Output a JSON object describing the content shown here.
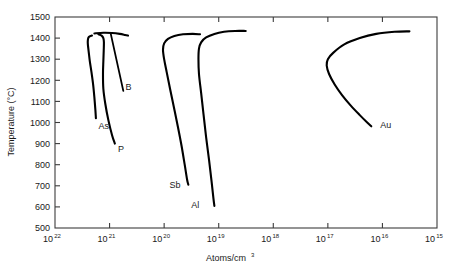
{
  "chart_data": {
    "type": "line",
    "title": "",
    "subtitle": "",
    "xlabel": "Atoms/cm",
    "xlabel_sup": "3",
    "ylabel": "Temperature (°C)",
    "xscale": "log",
    "x_reversed": true,
    "xlim": [
      1e+22,
      1000000000000000.0
    ],
    "ylim": [
      500,
      1500
    ],
    "grid": false,
    "legend_position": "inline-curve-labels",
    "xticks": [
      "10^22",
      "10^21",
      "10^20",
      "10^19",
      "10^18",
      "10^17",
      "10^16",
      "10^15"
    ],
    "xtick_mantissa": [
      "10",
      "10",
      "10",
      "10",
      "10",
      "10",
      "10",
      "10"
    ],
    "xtick_exponents": [
      "22",
      "21",
      "20",
      "19",
      "18",
      "17",
      "16",
      "15"
    ],
    "yticks": [
      1500,
      1400,
      1300,
      1200,
      1100,
      1000,
      900,
      800,
      700,
      600,
      500
    ],
    "ytick_labels": [
      "1500",
      "1400",
      "1300",
      "1200",
      "1100",
      "1000",
      "900",
      "800",
      "700",
      "600",
      "500"
    ],
    "series": [
      {
        "name": "As",
        "label": "As",
        "label_x_atoms": 1.6e+21,
        "label_y_temp": 970,
        "points": [
          [
            2.1e+21,
            1412
          ],
          [
            2.4e+21,
            1405
          ],
          [
            2.5e+21,
            1390
          ],
          [
            2.5e+21,
            1370
          ],
          [
            2.4e+21,
            1330
          ],
          [
            2.3e+21,
            1290
          ],
          [
            2.15e+21,
            1240
          ],
          [
            2e+21,
            1180
          ],
          [
            1.9e+21,
            1120
          ],
          [
            1.82e+21,
            1060
          ],
          [
            1.78e+21,
            1020
          ]
        ]
      },
      {
        "name": "P",
        "label": "P",
        "label_x_atoms": 7e+20,
        "label_y_temp": 860,
        "points": [
          [
            1.6e+21,
            1418
          ],
          [
            1.4e+21,
            1412
          ],
          [
            1.3e+21,
            1400
          ],
          [
            1.27e+21,
            1380
          ],
          [
            1.28e+21,
            1340
          ],
          [
            1.3e+21,
            1290
          ],
          [
            1.32e+21,
            1230
          ],
          [
            1.3e+21,
            1160
          ],
          [
            1.2e+21,
            1090
          ],
          [
            1.05e+21,
            1010
          ],
          [
            9e+20,
            940
          ],
          [
            8e+20,
            900
          ]
        ]
      },
      {
        "name": "B",
        "label": "B",
        "label_x_atoms": 5.1e+20,
        "label_y_temp": 1155,
        "leader_from": [
          9.5e+20,
          1420
        ],
        "leader_to": [
          5.6e+20,
          1150
        ],
        "points": [
          [
            1.9e+21,
            1422
          ],
          [
            1.3e+21,
            1425
          ],
          [
            9e+20,
            1424
          ],
          [
            6.5e+20,
            1420
          ],
          [
            5.2e+20,
            1415
          ],
          [
            4.6e+20,
            1412
          ]
        ]
      },
      {
        "name": "Sb",
        "label": "Sb",
        "label_x_atoms": 8e+19,
        "label_y_temp": 690,
        "points": [
          [
            2.2e+19,
            1418
          ],
          [
            3e+19,
            1420
          ],
          [
            4.5e+19,
            1418
          ],
          [
            6.5e+19,
            1410
          ],
          [
            8.5e+19,
            1396
          ],
          [
            1e+20,
            1375
          ],
          [
            1.05e+20,
            1345
          ],
          [
            1e+20,
            1300
          ],
          [
            9e+19,
            1240
          ],
          [
            7.8e+19,
            1160
          ],
          [
            6.6e+19,
            1070
          ],
          [
            5.6e+19,
            980
          ],
          [
            4.8e+19,
            890
          ],
          [
            4.2e+19,
            800
          ],
          [
            3.8e+19,
            730
          ],
          [
            3.6e+19,
            705
          ]
        ]
      },
      {
        "name": "Al",
        "label": "Al",
        "label_x_atoms": 3.2e+19,
        "label_y_temp": 595,
        "points": [
          [
            3.2e+18,
            1434
          ],
          [
            5e+18,
            1434
          ],
          [
            8e+18,
            1430
          ],
          [
            1.2e+19,
            1420
          ],
          [
            1.7e+19,
            1403
          ],
          [
            2.1e+19,
            1380
          ],
          [
            2.3e+19,
            1350
          ],
          [
            2.35e+19,
            1300
          ],
          [
            2.3e+19,
            1230
          ],
          [
            2.1e+19,
            1140
          ],
          [
            1.9e+19,
            1040
          ],
          [
            1.7e+19,
            930
          ],
          [
            1.5e+19,
            820
          ],
          [
            1.35e+19,
            720
          ],
          [
            1.25e+19,
            640
          ],
          [
            1.2e+19,
            605
          ]
        ]
      },
      {
        "name": "Au",
        "label": "Au",
        "label_x_atoms": 1.1e+16,
        "label_y_temp": 975,
        "points": [
          [
            3200000000000000.0,
            1432
          ],
          [
            6000000000000000.0,
            1430
          ],
          [
            1.3e+16,
            1420
          ],
          [
            2.6e+16,
            1400
          ],
          [
            5e+16,
            1370
          ],
          [
            8e+16,
            1330
          ],
          [
            1e+17,
            1300
          ],
          [
            1.05e+17,
            1270
          ],
          [
            9.5e+16,
            1230
          ],
          [
            7.5e+16,
            1180
          ],
          [
            5.5e+16,
            1130
          ],
          [
            3.8e+16,
            1080
          ],
          [
            2.6e+16,
            1035
          ],
          [
            1.9e+16,
            1000
          ],
          [
            1.6e+16,
            982
          ]
        ]
      }
    ]
  }
}
